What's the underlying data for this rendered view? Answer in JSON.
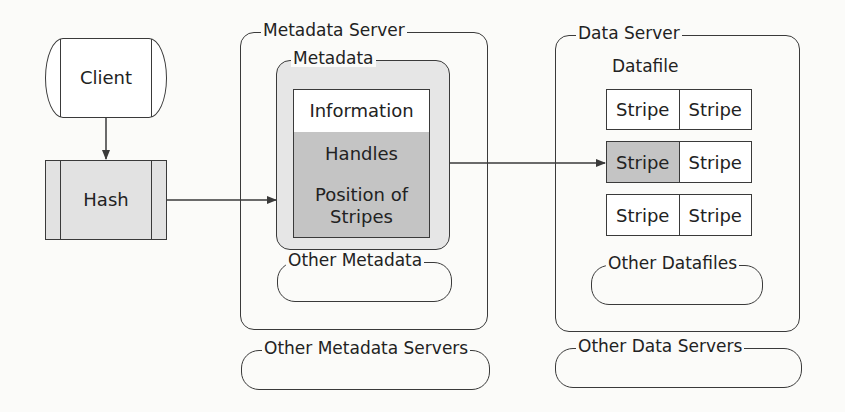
{
  "diagram": {
    "client": {
      "label": "Client"
    },
    "hash": {
      "label": "Hash"
    },
    "metadata_server": {
      "title": "Metadata Server",
      "metadata": {
        "title": "Metadata",
        "rows": [
          {
            "label": "Information",
            "shaded": false
          },
          {
            "label": "Handles",
            "shaded": true
          },
          {
            "label": "Position of Stripes",
            "shaded": true
          }
        ]
      },
      "other_metadata": {
        "title": "Other Metadata"
      }
    },
    "other_metadata_servers": {
      "title": "Other Metadata Servers"
    },
    "data_server": {
      "title": "Data Server",
      "datafile": {
        "title": "Datafile",
        "stripe_rows": [
          {
            "cells": [
              "Stripe",
              "Stripe"
            ],
            "shaded": [
              false,
              false
            ]
          },
          {
            "cells": [
              "Stripe",
              "Stripe"
            ],
            "shaded": [
              true,
              false
            ]
          },
          {
            "cells": [
              "Stripe",
              "Stripe"
            ],
            "shaded": [
              false,
              false
            ]
          }
        ]
      },
      "other_datafiles": {
        "title": "Other Datafiles"
      }
    },
    "other_data_servers": {
      "title": "Other Data Servers"
    },
    "edges": [
      {
        "from": "Client",
        "to": "Hash"
      },
      {
        "from": "Hash",
        "to": "Metadata"
      },
      {
        "from": "Handles",
        "to": "Stripe (row 2, col 1)"
      }
    ],
    "colors": {
      "line": "#3a3a3a",
      "shade_dark": "#c4c4c4",
      "shade_light": "#e6e6e6",
      "hash_fill": "#e2e2e2"
    }
  }
}
